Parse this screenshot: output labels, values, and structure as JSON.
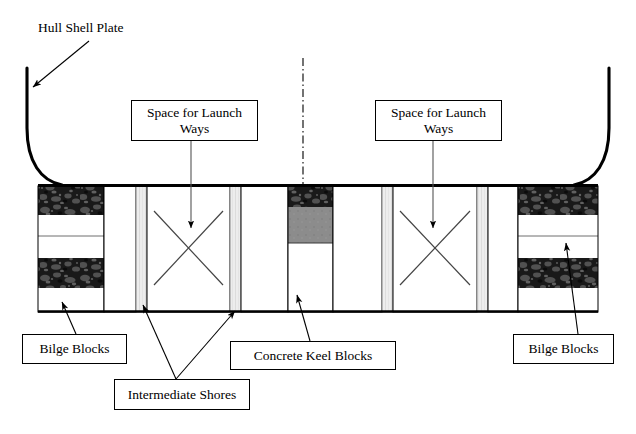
{
  "diagram": {
    "type": "engineering-cross-section",
    "canvas": {
      "width": 636,
      "height": 434
    },
    "colors": {
      "line": "#000000",
      "background": "#ffffff",
      "block_texture_dark": "#2b2b2b",
      "block_fill_white": "#ffffff",
      "keel_block_gray": "#8a8a8a",
      "shore_strip_gray": "#e2e2e2",
      "thin_rule": "#6e6e6e"
    }
  },
  "labels": {
    "hull_shell_plate": "Hull Shell Plate",
    "space_for_launch_ways_left": "Space for Launch\nWays",
    "space_for_launch_ways_right": "Space for Launch\nWays",
    "bilge_blocks_left": "Bilge  Blocks",
    "bilge_blocks_right": "Bilge Blocks",
    "intermediate_shores": "Intermediate Shores",
    "concrete_keel_blocks": "Concrete Keel Blocks"
  },
  "structure": {
    "deck_line_y": 185,
    "ground_line_y": 312,
    "block_region_left_x": 38,
    "block_region_right_x": 598,
    "centerline_x": 303,
    "components": [
      {
        "name": "bilge-block-left",
        "x": 38,
        "width": 66,
        "kind": "banded-bilge-block"
      },
      {
        "name": "launch-way-space-left",
        "x": 104,
        "width": 32,
        "kind": "open-bay"
      },
      {
        "name": "intermediate-shore-left-outer",
        "x": 136,
        "width": 11,
        "kind": "shore-strip"
      },
      {
        "name": "launch-ways-bay-left",
        "x": 147,
        "width": 83,
        "kind": "crossed-bay"
      },
      {
        "name": "intermediate-shore-left-inner",
        "x": 230,
        "width": 11,
        "kind": "shore-strip"
      },
      {
        "name": "open-bay-left-of-keel",
        "x": 241,
        "width": 47,
        "kind": "open-bay"
      },
      {
        "name": "concrete-keel-block",
        "x": 288,
        "width": 45,
        "kind": "keel-block"
      },
      {
        "name": "open-bay-right-of-keel",
        "x": 333,
        "width": 49,
        "kind": "open-bay"
      },
      {
        "name": "intermediate-shore-right-inner",
        "x": 382,
        "width": 11,
        "kind": "shore-strip"
      },
      {
        "name": "launch-ways-bay-right",
        "x": 393,
        "width": 84,
        "kind": "crossed-bay"
      },
      {
        "name": "intermediate-shore-right-outer",
        "x": 477,
        "width": 11,
        "kind": "shore-strip"
      },
      {
        "name": "launch-way-space-right",
        "x": 488,
        "width": 30,
        "kind": "open-bay"
      },
      {
        "name": "bilge-block-right",
        "x": 518,
        "width": 80,
        "kind": "banded-bilge-block"
      }
    ],
    "bilge_block_bands": [
      {
        "kind": "dark",
        "from_y": 185,
        "to_y": 215
      },
      {
        "kind": "white",
        "from_y": 215,
        "to_y": 236
      },
      {
        "kind": "white",
        "from_y": 236,
        "to_y": 258
      },
      {
        "kind": "dark",
        "from_y": 258,
        "to_y": 288
      },
      {
        "kind": "white",
        "from_y": 288,
        "to_y": 312
      }
    ],
    "keel_block_bands": [
      {
        "kind": "dark",
        "from_y": 185,
        "to_y": 207
      },
      {
        "kind": "gray",
        "from_y": 207,
        "to_y": 243
      },
      {
        "kind": "white",
        "from_y": 243,
        "to_y": 312
      }
    ]
  },
  "callouts": [
    {
      "name": "hull-shell-plate",
      "kind": "plain-text",
      "x": 38,
      "y": 20,
      "width": 104,
      "height": 18
    },
    {
      "name": "space-for-launch-ways-left",
      "kind": "box",
      "x": 131,
      "y": 100,
      "width": 127,
      "height": 41
    },
    {
      "name": "space-for-launch-ways-right",
      "kind": "box",
      "x": 375,
      "y": 100,
      "width": 127,
      "height": 41
    },
    {
      "name": "bilge-blocks-left",
      "kind": "box",
      "x": 22,
      "y": 334,
      "width": 105,
      "height": 30
    },
    {
      "name": "bilge-blocks-right",
      "kind": "box",
      "x": 513,
      "y": 334,
      "width": 101,
      "height": 30
    },
    {
      "name": "intermediate-shores",
      "kind": "box",
      "x": 114,
      "y": 379,
      "width": 136,
      "height": 31
    },
    {
      "name": "concrete-keel-blocks",
      "kind": "box",
      "x": 230,
      "y": 341,
      "width": 166,
      "height": 29
    }
  ]
}
